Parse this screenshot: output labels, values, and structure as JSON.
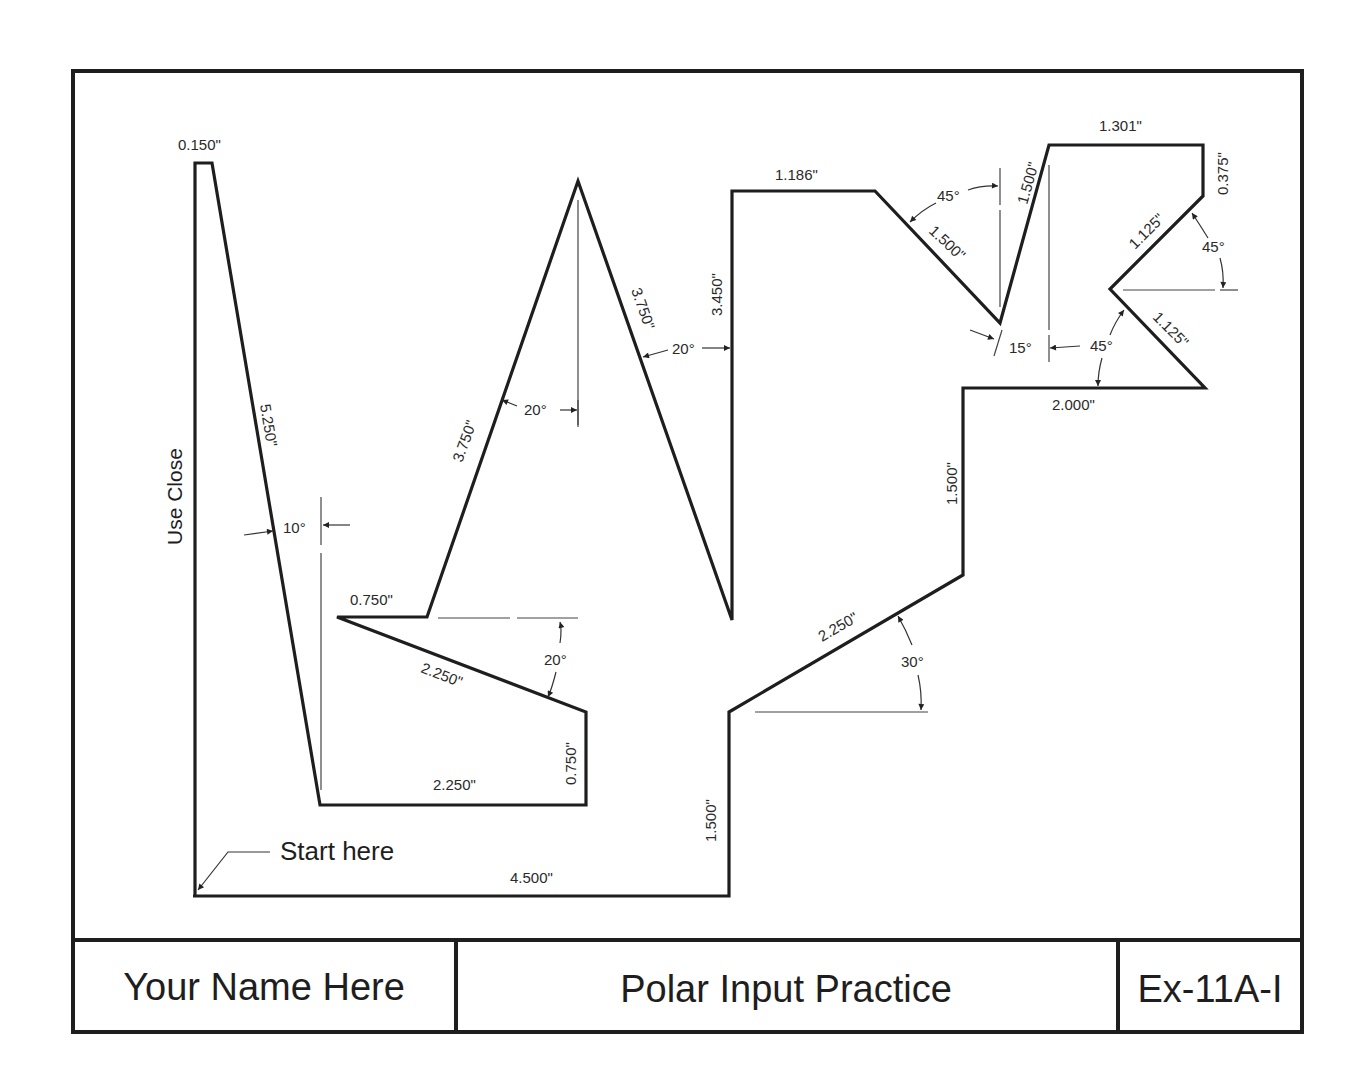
{
  "title_block": {
    "name": "Your Name Here",
    "title": "Polar Input Practice",
    "exercise": "Ex-11A-I"
  },
  "notes": {
    "start": "Start here",
    "close": "Use Close"
  },
  "dimensions": {
    "d_0150": "0.150\"",
    "d_5250": "5.250\"",
    "d_10deg": "10°",
    "d_0750_top": "0.750\"",
    "d_2250_slant": "2.250\"",
    "d_20deg_lower": "20°",
    "d_0750_vert": "0.750\"",
    "d_2250_bottom": "2.250\"",
    "d_3750_left": "3.750\"",
    "d_20deg_left": "20°",
    "d_3750_right": "3.750\"",
    "d_20deg_right": "20°",
    "d_3450": "3.450\"",
    "d_1500_lower_vert": "1.500\"",
    "d_4500": "4.500\"",
    "d_1186": "1.186\"",
    "d_45deg_top": "45°",
    "d_1500_diag": "1.500\"",
    "d_1500_steep": "1.500\"",
    "d_15deg": "15°",
    "d_1301": "1.301\"",
    "d_0375": "0.375\"",
    "d_1125_upper": "1.125\"",
    "d_45deg_right": "45°",
    "d_1125_lower": "1.125\"",
    "d_45deg_lower": "45°",
    "d_2000": "2.000\"",
    "d_1500_mid_vert": "1.500\"",
    "d_2250_rising": "2.250\"",
    "d_30deg": "30°"
  }
}
